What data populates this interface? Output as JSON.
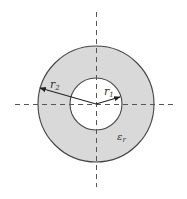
{
  "diagram": {
    "type": "coaxial-cross-section",
    "labels": {
      "outer_radius": {
        "base": "r",
        "sub": "2"
      },
      "inner_radius": {
        "base": "r",
        "sub": "1"
      },
      "permittivity": {
        "base": "ε",
        "sub": "r"
      }
    },
    "colors": {
      "dielectric_fill": "#d9d9d9",
      "outline": "#444444",
      "axis": "#555555",
      "background": "#ffffff"
    },
    "geometry": {
      "center": [
        96,
        104
      ],
      "outer_radius_px": 58,
      "inner_radius_px": 26
    }
  }
}
